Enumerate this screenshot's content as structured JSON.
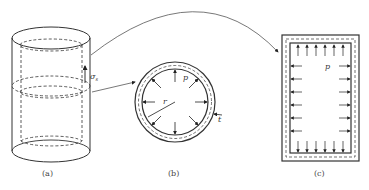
{
  "panels": [
    {
      "id": "a",
      "caption": "(a)",
      "labels": {
        "stress": "σ",
        "stress_sub": "s"
      }
    },
    {
      "id": "b",
      "caption": "(b)",
      "labels": {
        "pressure": "p",
        "radius": "r",
        "thickness": "t"
      }
    },
    {
      "id": "c",
      "caption": "(c)",
      "labels": {
        "pressure": "p"
      }
    }
  ],
  "colors": {
    "stroke": "#333333",
    "background": "#ffffff"
  }
}
